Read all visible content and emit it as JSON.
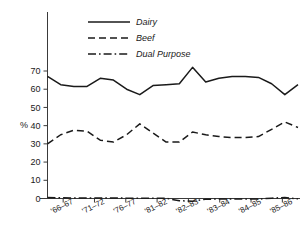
{
  "chart_data": {
    "type": "line",
    "title": "",
    "xlabel": "",
    "ylabel": "%",
    "ylim": [
      0,
      75
    ],
    "yticks": [
      0,
      10,
      20,
      30,
      40,
      50,
      60,
      70
    ],
    "ytick_labels": [
      "0",
      "10",
      "20",
      "30",
      "40",
      "50",
      "60",
      "70"
    ],
    "grid": false,
    "legend_position": "top-center",
    "categories": [
      "'66–67",
      "'71–72",
      "'76–77",
      "'81–82",
      "'82–83",
      "'83–84",
      "'84–85",
      "'85–86"
    ],
    "x_tick_labels": [
      "'66–67",
      "'71–72",
      "'76–77",
      "'81–82",
      "'82–83",
      "'83–84",
      "'84–85",
      "'85–86"
    ],
    "series": [
      {
        "name": "Dairy",
        "style": "solid",
        "color": "#1a1a1a",
        "x": [
          0,
          1,
          2,
          3,
          4,
          5,
          6,
          7,
          8,
          9,
          10,
          11,
          12,
          13,
          14,
          15,
          16,
          17,
          18,
          19
        ],
        "values": [
          67,
          62.5,
          61.5,
          61.5,
          66,
          65,
          60,
          57,
          62,
          62.5,
          63,
          72,
          64,
          66,
          67,
          67,
          66.5,
          63,
          57,
          62.5
        ]
      },
      {
        "name": "Beef",
        "style": "dashed",
        "color": "#1a1a1a",
        "x": [
          0,
          1,
          2,
          3,
          4,
          5,
          6,
          7,
          8,
          9,
          10,
          11,
          12,
          13,
          14,
          15,
          16,
          17,
          18,
          19
        ],
        "values": [
          30,
          35,
          37.5,
          37,
          32,
          31,
          35,
          41,
          36,
          31,
          31,
          36.5,
          35,
          34,
          33.5,
          33.5,
          34,
          38,
          42,
          39
        ]
      },
      {
        "name": "Dual Purpose",
        "style": "dashdot",
        "color": "#1a1a1a",
        "x": [
          0,
          1,
          2,
          3,
          4,
          5,
          6,
          7,
          8,
          9,
          10,
          11,
          12,
          13,
          14,
          15,
          16,
          17,
          18,
          19
        ],
        "values": [
          0.5,
          0.4,
          0.3,
          0.3,
          0.3,
          0.3,
          0.2,
          0.2,
          0.2,
          0.1,
          -1.2,
          -1.5,
          -0.4,
          -0.3,
          -0.3,
          -0.3,
          -0.3,
          0.2,
          0.5,
          -0.2
        ]
      }
    ]
  },
  "legend": {
    "items": [
      {
        "label": "Dairy",
        "style": "solid"
      },
      {
        "label": "Beef",
        "style": "dashed"
      },
      {
        "label": "Dual Purpose",
        "style": "dashdot"
      }
    ]
  },
  "axes": {
    "y_axis_title": "%",
    "y_tick_labels": [
      "70",
      "60",
      "50",
      "40",
      "30",
      "20",
      "10",
      "0"
    ],
    "x_tick_labels": [
      "'66–67",
      "'71–72",
      "'76–77",
      "'81–82",
      "'82–83",
      "'83–84",
      "'84–85",
      "'85–86"
    ]
  },
  "colors": {
    "line": "#1a1a1a",
    "axis": "#3a3a3a",
    "background": "#ffffff"
  }
}
